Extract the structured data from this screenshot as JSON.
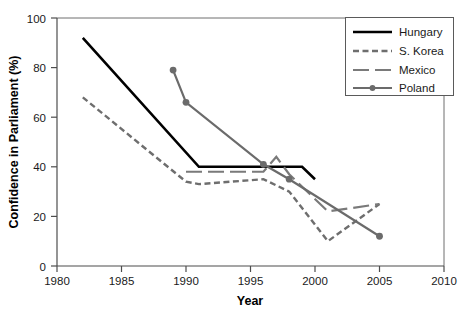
{
  "chart_data": {
    "type": "line",
    "title": "",
    "xlabel": "Year",
    "ylabel": "Confidence in Parliament (%)",
    "xlim": [
      1980,
      2010
    ],
    "ylim": [
      0,
      100
    ],
    "xticks": [
      1980,
      1985,
      1990,
      1995,
      2000,
      2005,
      2010
    ],
    "yticks": [
      0,
      20,
      40,
      60,
      80,
      100
    ],
    "grid": false,
    "legend_position": "top-right",
    "series": [
      {
        "name": "Hungary",
        "color": "#000000",
        "style": "solid",
        "marker": "none",
        "points": [
          {
            "x": 1982,
            "y": 92
          },
          {
            "x": 1991,
            "y": 40
          },
          {
            "x": 1999,
            "y": 40
          },
          {
            "x": 2000,
            "y": 35
          }
        ]
      },
      {
        "name": "S. Korea",
        "color": "#6e6e6e",
        "style": "dashed",
        "marker": "none",
        "points": [
          {
            "x": 1982,
            "y": 68
          },
          {
            "x": 1990,
            "y": 34
          },
          {
            "x": 1991,
            "y": 33
          },
          {
            "x": 1996,
            "y": 35
          },
          {
            "x": 1998,
            "y": 30
          },
          {
            "x": 2001,
            "y": 10
          },
          {
            "x": 2005,
            "y": 25
          }
        ]
      },
      {
        "name": "Mexico",
        "color": "#7a7a7a",
        "style": "longdash",
        "marker": "none",
        "points": [
          {
            "x": 1990,
            "y": 38
          },
          {
            "x": 1996,
            "y": 38
          },
          {
            "x": 1997,
            "y": 44
          },
          {
            "x": 1998,
            "y": 37
          },
          {
            "x": 2001,
            "y": 22
          },
          {
            "x": 2005,
            "y": 25
          }
        ]
      },
      {
        "name": "Poland",
        "color": "#6b6b6b",
        "style": "solid",
        "marker": "circle",
        "points": [
          {
            "x": 1989,
            "y": 79
          },
          {
            "x": 1990,
            "y": 66
          },
          {
            "x": 1996,
            "y": 41
          },
          {
            "x": 1998,
            "y": 35
          },
          {
            "x": 2005,
            "y": 12
          }
        ]
      }
    ]
  },
  "legend": {
    "entries": [
      {
        "label": "Hungary"
      },
      {
        "label": "S. Korea"
      },
      {
        "label": "Mexico"
      },
      {
        "label": "Poland"
      }
    ]
  }
}
